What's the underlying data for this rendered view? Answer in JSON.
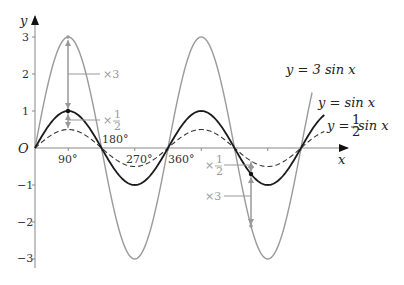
{
  "chart_data": {
    "type": "line",
    "title": "",
    "xlabel": "x",
    "ylabel": "y",
    "origin_label": "O",
    "xlim_deg": [
      0,
      790
    ],
    "ylim": [
      -3.2,
      3.5
    ],
    "grid": false,
    "x_ticks": [
      {
        "value": 90,
        "label": "90°"
      },
      {
        "value": 180,
        "label": "180°"
      },
      {
        "value": 270,
        "label": "270°"
      },
      {
        "value": 360,
        "label": "360°"
      },
      {
        "value": 450,
        "label": ""
      },
      {
        "value": 540,
        "label": ""
      },
      {
        "value": 630,
        "label": ""
      },
      {
        "value": 720,
        "label": ""
      }
    ],
    "y_ticks": [
      {
        "value": 3,
        "label": "3"
      },
      {
        "value": 2,
        "label": "2"
      },
      {
        "value": 1,
        "label": "1"
      },
      {
        "value": -1,
        "label": "−1"
      },
      {
        "value": -2,
        "label": "−2"
      },
      {
        "value": -3,
        "label": "−3"
      }
    ],
    "series": [
      {
        "name": "y = 3 sin x",
        "amplitude": 3,
        "color": "#9a9a9a",
        "style": "solid",
        "x_end_deg": 750
      },
      {
        "name": "y = sin x",
        "amplitude": 1,
        "color": "#1a1a1a",
        "style": "solid",
        "x_end_deg": 785
      },
      {
        "name": "y = ½ sin x",
        "amplitude": 0.5,
        "color": "#333333",
        "style": "dashed",
        "x_end_deg": 785
      }
    ],
    "annotations": [
      {
        "x_deg": 90,
        "from": 1,
        "to": 3,
        "label": "×3"
      },
      {
        "x_deg": 90,
        "from": 1,
        "to": 0.5,
        "label": "×½"
      },
      {
        "x_deg": 585,
        "from": -0.707,
        "to": -2.121,
        "label": "×3"
      },
      {
        "x_deg": 585,
        "from": -0.707,
        "to": -0.354,
        "label": "×½"
      }
    ]
  },
  "labels": {
    "y_axis": "y",
    "x_axis": "x",
    "origin": "O",
    "tick_90": "90°",
    "tick_180": "180°",
    "tick_270": "270°",
    "tick_360": "360°",
    "y3": "3",
    "y2": "2",
    "y1": "1",
    "ym1": "−1",
    "ym2": "−2",
    "ym3": "−3",
    "eq_3sin_prefix": "y = 3 sin x",
    "eq_sin": "y = sin x",
    "eq_half_prefix": "y = ",
    "eq_half_num": "1",
    "eq_half_den": "2",
    "eq_half_suffix": " sin x",
    "ann_times3": "×3",
    "ann_times": "×",
    "ann_half_num": "1",
    "ann_half_den": "2"
  }
}
